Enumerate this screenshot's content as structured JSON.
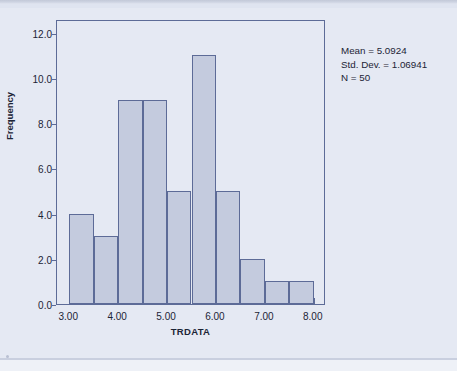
{
  "chart_data": {
    "type": "bar",
    "title": "",
    "subtitle": "",
    "xlabel": "TRDATA",
    "ylabel": "Frequency",
    "xlim": [
      2.75,
      8.25
    ],
    "ylim": [
      0,
      12.6
    ],
    "grid": false,
    "legend": null,
    "bin_width": 0.5,
    "categories": [
      "3.00-3.50",
      "3.50-4.00",
      "4.00-4.50",
      "4.50-5.00",
      "5.00-5.50",
      "5.50-6.00",
      "6.00-6.50",
      "6.50-7.00",
      "7.00-7.50",
      "7.50-8.00"
    ],
    "bin_starts": [
      3.0,
      3.5,
      4.0,
      4.5,
      5.0,
      5.5,
      6.0,
      6.5,
      7.0,
      7.5
    ],
    "bin_ends": [
      3.5,
      4.0,
      4.5,
      5.0,
      5.5,
      6.0,
      6.5,
      7.0,
      7.5,
      8.0
    ],
    "values": [
      4,
      3,
      9,
      9,
      5,
      11,
      5,
      2,
      1,
      1
    ],
    "x_ticks": [
      3.0,
      4.0,
      5.0,
      6.0,
      7.0,
      8.0
    ],
    "x_tick_labels": [
      "3.00",
      "4.00",
      "5.00",
      "6.00",
      "7.00",
      "8.00"
    ],
    "x_minor_ticks": [
      3.5,
      4.5,
      5.5,
      6.5,
      7.5
    ],
    "y_ticks": [
      0,
      2,
      4,
      6,
      8,
      10,
      12
    ],
    "y_tick_labels": [
      "0.0",
      "2.0",
      "4.0",
      "6.0",
      "8.0",
      "10.0",
      "12.0"
    ],
    "annotations": [
      "Mean = 5.0924",
      "Std. Dev. = 1.06941",
      "N = 50"
    ],
    "colors": {
      "bar_fill": "#c4cbde",
      "bar_border": "#5d6b97",
      "plot_background": "#e5e9f3",
      "page_background": "#e5e9f3",
      "axis": "#5d6b97",
      "text": "#1c2436"
    }
  },
  "stats": {
    "mean_label": "Mean = 5.0924",
    "stddev_label": "Std. Dev. = 1.06941",
    "n_label": "N = 50"
  },
  "axes": {
    "y_title": "Frequency",
    "x_title": "TRDATA"
  }
}
